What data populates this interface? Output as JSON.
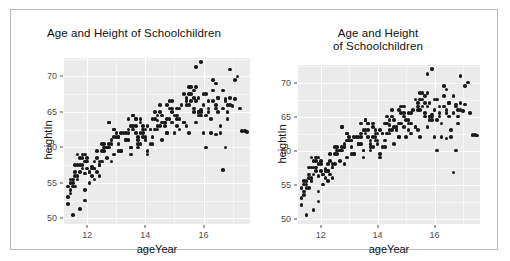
{
  "figure": {
    "background": "#ffffff",
    "border_color": "#b9b9b9",
    "panel_background": "#ebebeb",
    "grid_color": "#ffffff",
    "point_color": "#1a1a1a"
  },
  "panels": [
    {
      "name": "left",
      "title_lines": [
        "Age and Height of Schoolchildren"
      ]
    },
    {
      "name": "right",
      "title_lines": [
        "Age and Height",
        "of Schoolchildren"
      ]
    }
  ],
  "chart_data": {
    "type": "scatter",
    "title": "Age and Height of Schoolchildren",
    "xlabel": "ageYear",
    "ylabel": "heightIn",
    "xlim": [
      11.2,
      17.6
    ],
    "ylim": [
      49.2,
      72.6
    ],
    "xticks": [
      12,
      14,
      16
    ],
    "yticks": [
      50,
      55,
      60,
      65,
      70
    ],
    "xtick_labels": [
      "12",
      "14",
      "16"
    ],
    "ytick_labels": [
      "50",
      "55",
      "60",
      "65",
      "70"
    ],
    "grid": true,
    "legend": "none",
    "n_points": 236,
    "x": [
      11.92,
      12.92,
      12.75,
      13.42,
      15.92,
      14.25,
      15.42,
      11.92,
      13.58,
      12.58,
      13.92,
      14.92,
      12.17,
      14.42,
      15.75,
      12.25,
      13.08,
      14.75,
      11.75,
      16.42,
      12.42,
      13.25,
      14.08,
      15.08,
      16.92,
      11.58,
      12.08,
      13.75,
      14.58,
      15.25,
      16.08,
      17.08,
      11.42,
      12.33,
      13.17,
      14.17,
      15.17,
      16.17,
      17.17,
      11.67,
      12.67,
      13.67,
      14.67,
      15.67,
      16.67,
      11.83,
      12.83,
      13.83,
      14.83,
      15.83,
      16.83,
      12.0,
      13.0,
      14.0,
      15.0,
      16.0,
      17.0,
      11.5,
      12.5,
      13.5,
      14.5,
      15.5,
      16.5,
      11.33,
      12.25,
      13.33,
      14.33,
      15.33,
      16.33,
      17.33,
      11.58,
      12.75,
      13.58,
      14.75,
      15.58,
      16.75,
      11.92,
      12.08,
      13.92,
      14.08,
      15.92,
      16.08,
      17.42,
      11.75,
      12.92,
      13.75,
      14.92,
      15.75,
      16.92,
      11.42,
      12.58,
      13.42,
      14.58,
      15.42,
      16.58,
      11.67,
      12.17,
      13.67,
      14.17,
      15.67,
      16.17,
      11.83,
      12.42,
      13.83,
      14.42,
      15.83,
      16.42,
      12.33,
      13.08,
      14.33,
      15.08,
      16.33,
      11.5,
      12.67,
      13.5,
      14.67,
      15.5,
      16.67,
      11.33,
      12.83,
      13.33,
      14.83,
      15.33,
      16.83,
      12.0,
      13.17,
      14.0,
      15.17,
      16.0,
      17.25,
      11.58,
      12.5,
      13.58,
      14.5,
      15.58,
      16.5,
      11.92,
      12.25,
      13.92,
      14.25,
      15.92,
      16.25,
      11.75,
      12.75,
      13.75,
      14.75,
      15.75,
      16.75,
      11.42,
      12.92,
      13.42,
      14.92,
      15.42,
      17.08,
      11.67,
      12.08,
      13.67,
      14.08,
      15.67,
      16.08,
      11.83,
      12.58,
      13.83,
      14.58,
      15.83,
      16.58,
      12.42,
      13.08,
      14.42,
      15.08,
      16.42,
      11.5,
      12.17,
      13.5,
      14.17,
      15.5,
      16.17,
      11.33,
      12.33,
      13.33,
      14.33,
      15.33,
      16.33,
      12.67,
      13.17,
      14.67,
      15.17,
      16.67,
      11.58,
      12.83,
      13.58,
      14.83,
      15.58,
      16.83,
      11.92,
      13.0,
      13.92,
      15.0,
      15.92,
      17.5,
      11.75,
      12.5,
      13.75,
      14.5,
      15.75,
      16.5,
      11.42,
      12.25,
      13.42,
      14.25,
      15.42,
      16.25,
      11.67,
      12.75,
      13.67,
      14.75,
      15.67,
      16.75,
      11.83,
      12.92,
      13.83,
      14.92,
      15.83,
      16.92,
      12.0,
      13.08,
      14.0,
      15.08,
      16.0,
      11.5,
      12.42,
      13.5,
      14.42,
      15.5,
      16.42
    ],
    "y": [
      56.3,
      59.0,
      63.5,
      62.0,
      65.3,
      64.0,
      67.0,
      52.5,
      63.0,
      60.0,
      62.5,
      66.5,
      57.3,
      63.8,
      68.5,
      58.0,
      60.5,
      66.0,
      51.3,
      69.0,
      57.5,
      62.0,
      63.0,
      65.5,
      71.0,
      54.5,
      56.5,
      61.5,
      64.5,
      66.0,
      67.5,
      69.5,
      55.0,
      58.5,
      59.5,
      62.5,
      64.0,
      66.5,
      70.0,
      56.0,
      60.0,
      64.0,
      63.5,
      65.0,
      68.0,
      57.0,
      61.0,
      60.5,
      65.5,
      67.0,
      66.0,
      58.5,
      62.0,
      61.5,
      64.5,
      62.0,
      65.8,
      55.5,
      59.5,
      63.0,
      66.0,
      68.5,
      65.0,
      53.0,
      57.0,
      61.0,
      62.5,
      63.5,
      66.5,
      62.3,
      56.5,
      60.5,
      64.5,
      62.0,
      67.5,
      66.8,
      58.0,
      55.0,
      61.5,
      59.0,
      72.0,
      60.0,
      62.3,
      57.5,
      62.5,
      60.5,
      65.0,
      71.3,
      67.0,
      54.0,
      59.5,
      64.0,
      61.0,
      66.5,
      63.0,
      55.5,
      56.0,
      62.0,
      60.5,
      68.0,
      65.5,
      58.5,
      57.5,
      63.5,
      62.5,
      64.5,
      66.0,
      56.5,
      61.5,
      65.0,
      64.0,
      69.5,
      50.5,
      60.0,
      59.0,
      63.0,
      67.5,
      65.5,
      54.5,
      58.0,
      62.0,
      66.5,
      63.5,
      64.0,
      57.0,
      59.5,
      61.0,
      62.5,
      66.0,
      65.5,
      56.0,
      60.5,
      64.5,
      63.0,
      68.5,
      67.0,
      59.0,
      55.5,
      62.0,
      61.5,
      65.0,
      62.0,
      58.5,
      63.5,
      60.0,
      64.0,
      66.5,
      60.0,
      53.5,
      62.5,
      61.0,
      65.5,
      63.0,
      66.8,
      57.5,
      56.5,
      64.0,
      59.5,
      67.0,
      64.5,
      59.0,
      60.5,
      62.0,
      63.5,
      65.0,
      62.0,
      58.0,
      61.5,
      64.5,
      63.0,
      61.8,
      55.0,
      57.0,
      60.0,
      62.5,
      66.0,
      65.0,
      52.0,
      59.5,
      61.0,
      64.0,
      67.5,
      68.0,
      58.5,
      62.0,
      63.5,
      65.5,
      56.8,
      57.5,
      60.5,
      62.5,
      64.0,
      66.5,
      65.0,
      54.0,
      61.5,
      63.0,
      62.0,
      64.5,
      62.2,
      56.5,
      58.0,
      61.0,
      65.0,
      63.5,
      67.0,
      55.5,
      57.0,
      62.5,
      60.5,
      66.0,
      64.0,
      59.0,
      60.0,
      63.0,
      62.0,
      65.5,
      66.5,
      57.5,
      61.5,
      64.0,
      63.5,
      65.0,
      66.0,
      58.0,
      59.5,
      62.5,
      64.5,
      67.5,
      54.5,
      56.0,
      60.0,
      63.0,
      62.0,
      65.5
    ]
  }
}
